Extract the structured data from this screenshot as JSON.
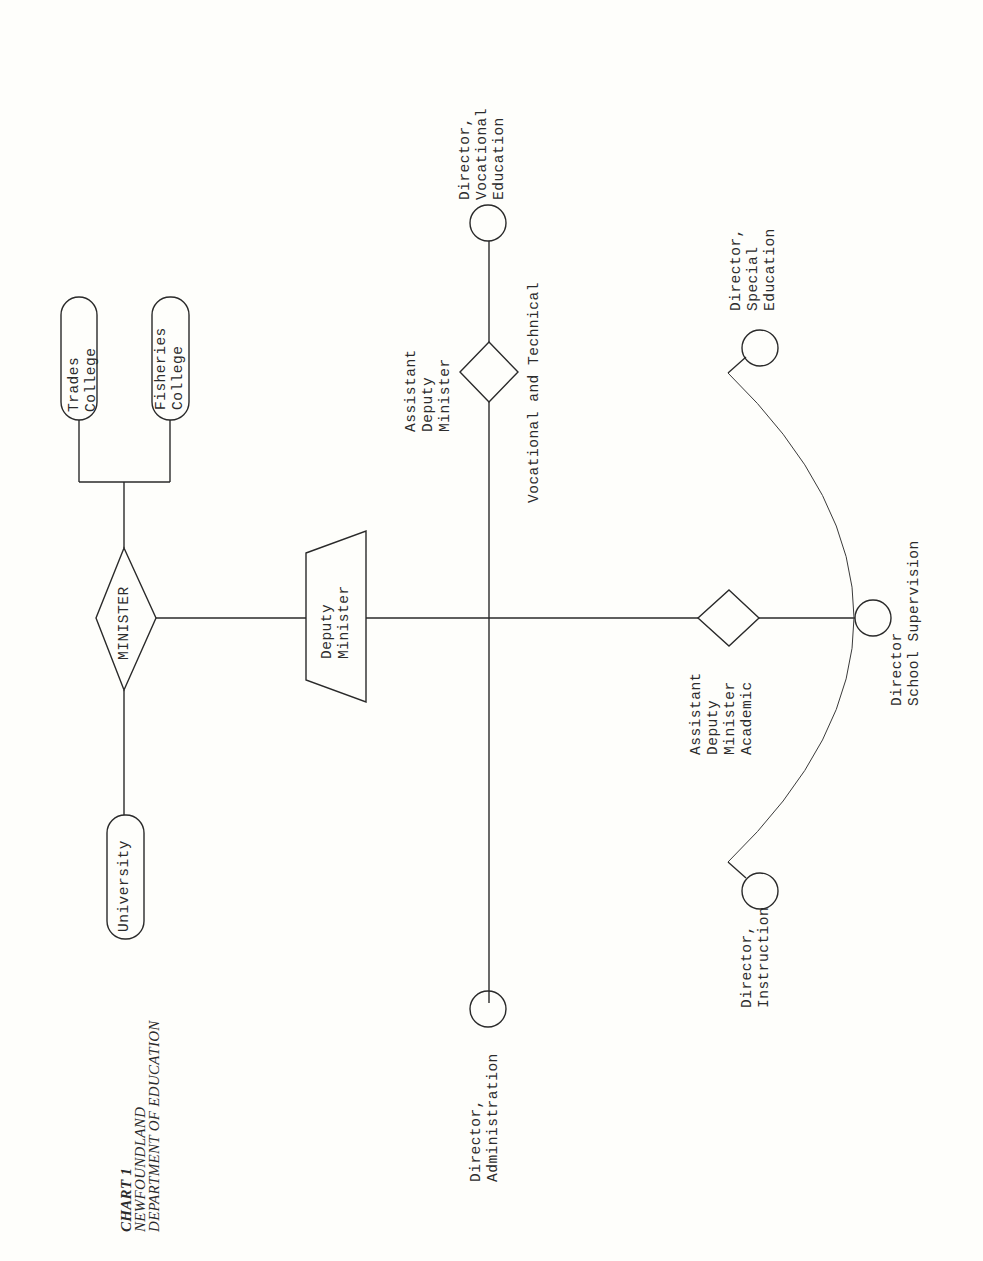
{
  "title": {
    "chart_number": "CHART 1",
    "line1": "NEWFOUNDLAND",
    "line2": "DEPARTMENT OF EDUCATION"
  },
  "nodes": {
    "minister": {
      "label": "MINISTER",
      "shape": "diamond"
    },
    "deputy_minister": {
      "line1": "Deputy",
      "line2": "Minister",
      "shape": "trapezoid"
    },
    "university": {
      "label": "University",
      "shape": "pill"
    },
    "trades_college": {
      "line1": "Trades",
      "line2": "College",
      "shape": "pill"
    },
    "fisheries_college": {
      "line1": "Fisheries",
      "line2": "College",
      "shape": "pill"
    },
    "adm_vocational": {
      "line1": "Assistant",
      "line2": "Deputy",
      "line3": "Minister",
      "sublabel": "Vocational and Technical",
      "shape": "diamond"
    },
    "adm_academic": {
      "line1": "Assistant",
      "line2": "Deputy",
      "line3": "Minister",
      "line4": "Academic",
      "shape": "diamond"
    },
    "dir_vocational": {
      "line1": "Director,",
      "line2": "Vocational",
      "line3": "Education",
      "shape": "circle"
    },
    "dir_administration": {
      "line1": "Director,",
      "line2": "Administration",
      "shape": "circle"
    },
    "dir_school_supervision": {
      "line1": "Director",
      "line2": "School Supervision",
      "shape": "circle"
    },
    "dir_special_education": {
      "line1": "Director,",
      "line2": "Special",
      "line3": "Education",
      "shape": "circle"
    },
    "dir_instruction": {
      "line1": "Director,",
      "line2": "Instruction",
      "shape": "circle"
    }
  },
  "edges": [
    [
      "minister",
      "trades_college"
    ],
    [
      "minister",
      "fisheries_college"
    ],
    [
      "minister",
      "university"
    ],
    [
      "minister",
      "deputy_minister"
    ],
    [
      "deputy_minister",
      "adm_vocational"
    ],
    [
      "deputy_minister",
      "adm_academic"
    ],
    [
      "deputy_minister",
      "dir_administration"
    ],
    [
      "adm_vocational",
      "dir_vocational"
    ],
    [
      "adm_academic",
      "dir_school_supervision"
    ],
    [
      "adm_academic",
      "dir_special_education"
    ],
    [
      "adm_academic",
      "dir_instruction"
    ]
  ]
}
